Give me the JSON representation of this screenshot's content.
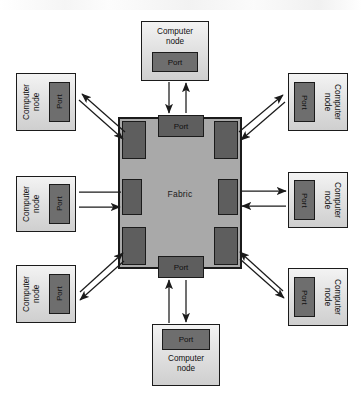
{
  "diagram": {
    "type": "block-diagram",
    "colors": {
      "fabric_fill": "#a9a9a9",
      "port_fill": "#5e5e5e",
      "node_fill": "#e2e2e2",
      "outline": "#1b1b1b",
      "background": "#ffffff"
    }
  },
  "fabric": {
    "label": "Fabric",
    "ports": [
      {
        "id": "fabric-port-top",
        "label": "Port",
        "position": "top-center"
      },
      {
        "id": "fabric-port-bottom",
        "label": "Port",
        "position": "bottom-center"
      }
    ],
    "pads": [
      {
        "id": "fabric-pad-top-left",
        "position": "top-left"
      },
      {
        "id": "fabric-pad-top-right",
        "position": "top-right"
      },
      {
        "id": "fabric-pad-mid-left",
        "position": "middle-left"
      },
      {
        "id": "fabric-pad-mid-right",
        "position": "middle-right"
      },
      {
        "id": "fabric-pad-bottom-left",
        "position": "bottom-left"
      },
      {
        "id": "fabric-pad-bottom-right",
        "position": "bottom-right"
      }
    ]
  },
  "nodes": [
    {
      "id": "node-top",
      "label": "Computer\nnode",
      "port_label": "Port",
      "position": "top"
    },
    {
      "id": "node-bottom",
      "label": "Computer\nnode",
      "port_label": "Port",
      "position": "bottom"
    },
    {
      "id": "node-lt",
      "label": "Computer\nnode",
      "port_label": "Port",
      "position": "upper-left"
    },
    {
      "id": "node-lm",
      "label": "Computer\nnode",
      "port_label": "Port",
      "position": "middle-left"
    },
    {
      "id": "node-lb",
      "label": "Computer\nnode",
      "port_label": "Port",
      "position": "lower-left"
    },
    {
      "id": "node-rt",
      "label": "Computer\nnode",
      "port_label": "Port",
      "position": "upper-right"
    },
    {
      "id": "node-rm",
      "label": "Computer\nnode",
      "port_label": "Port",
      "position": "middle-right"
    },
    {
      "id": "node-rb",
      "label": "Computer\nnode",
      "port_label": "Port",
      "position": "lower-right"
    }
  ],
  "links": [
    {
      "from": "node-top",
      "to": "fabric",
      "direction": "bidirectional"
    },
    {
      "from": "node-bottom",
      "to": "fabric",
      "direction": "bidirectional"
    },
    {
      "from": "node-lt",
      "to": "fabric",
      "direction": "bidirectional"
    },
    {
      "from": "node-lm",
      "to": "fabric",
      "direction": "bidirectional"
    },
    {
      "from": "node-lb",
      "to": "fabric",
      "direction": "bidirectional"
    },
    {
      "from": "node-rt",
      "to": "fabric",
      "direction": "bidirectional"
    },
    {
      "from": "node-rm",
      "to": "fabric",
      "direction": "bidirectional"
    },
    {
      "from": "node-rb",
      "to": "fabric",
      "direction": "bidirectional"
    }
  ]
}
